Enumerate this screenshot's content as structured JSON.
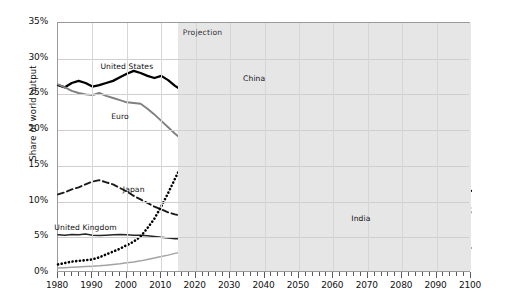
{
  "chart_data": {
    "type": "line",
    "title": "",
    "xlabel": "",
    "ylabel": "Share of world output",
    "xlim": [
      1980,
      2100
    ],
    "ylim": [
      0,
      35
    ],
    "grid": true,
    "legend_position": "inline-annotations",
    "y_tick_labels": [
      "35%",
      "30%",
      "25%",
      "20%",
      "15%",
      "10%",
      "5%",
      "0%"
    ],
    "y_tick_values": [
      35,
      30,
      25,
      20,
      15,
      10,
      5,
      0
    ],
    "x_tick_labels": [
      "1980",
      "1990",
      "2000",
      "2010",
      "2020",
      "2030",
      "2040",
      "2050",
      "2060",
      "2070",
      "2080",
      "2090",
      "2100"
    ],
    "x_tick_values": [
      1980,
      1990,
      2000,
      2010,
      2020,
      2030,
      2040,
      2050,
      2060,
      2070,
      2080,
      2090,
      2100
    ],
    "x_minor_tick_interval": 2,
    "annotations": [
      {
        "text": "Projection",
        "x": 2022,
        "y": 33.6,
        "kind": "region-label"
      }
    ],
    "shaded_regions": [
      {
        "label": "Projection",
        "x_start": 2015,
        "x_end": 2100,
        "color": "#e6e6e6"
      }
    ],
    "series": [
      {
        "name": "United States",
        "label_x": 2000,
        "label_y": 28.9,
        "style": "solid-thick",
        "color": "#000000",
        "x": [
          1980,
          1982,
          1984,
          1986,
          1988,
          1990,
          1992,
          1994,
          1996,
          1998,
          2000,
          2002,
          2004,
          2006,
          2008,
          2010,
          2012,
          2014,
          2015,
          2020,
          2025,
          2030,
          2035,
          2040,
          2045,
          2050,
          2055,
          2060,
          2065,
          2070,
          2075,
          2080,
          2085,
          2090,
          2095,
          2100
        ],
        "values": [
          26.3,
          26.0,
          26.6,
          26.9,
          26.6,
          26.1,
          26.3,
          26.6,
          26.9,
          27.4,
          27.9,
          28.3,
          28.0,
          27.6,
          27.3,
          27.6,
          27.0,
          26.2,
          25.9,
          24.6,
          23.4,
          22.2,
          21.0,
          19.8,
          18.7,
          17.6,
          16.6,
          15.7,
          14.9,
          14.2,
          13.5,
          12.9,
          12.4,
          12.0,
          11.7,
          11.5
        ]
      },
      {
        "name": "Euro",
        "label_x": 1998,
        "label_y": 21.8,
        "style": "solid-gray",
        "color": "#808080",
        "x": [
          1980,
          1982,
          1984,
          1986,
          1988,
          1990,
          1992,
          1994,
          1996,
          1998,
          2000,
          2002,
          2004,
          2006,
          2008,
          2010,
          2012,
          2014,
          2015,
          2020,
          2025,
          2030,
          2035,
          2040,
          2045,
          2050,
          2055,
          2060,
          2065,
          2070,
          2075,
          2080,
          2085,
          2090,
          2095,
          2100
        ],
        "values": [
          26.4,
          26.0,
          25.5,
          25.2,
          25.0,
          24.9,
          25.2,
          24.8,
          24.5,
          24.2,
          23.9,
          23.8,
          23.7,
          23.0,
          22.2,
          21.3,
          20.4,
          19.5,
          19.1,
          17.4,
          16.0,
          14.8,
          13.7,
          12.8,
          12.0,
          11.3,
          10.7,
          10.2,
          9.8,
          9.5,
          9.2,
          9.0,
          8.8,
          8.7,
          8.6,
          8.5
        ]
      },
      {
        "name": "Japan",
        "label_x": 2002,
        "label_y": 11.6,
        "style": "dashed",
        "color": "#1a1a1a",
        "x": [
          1980,
          1982,
          1984,
          1986,
          1988,
          1990,
          1992,
          1994,
          1996,
          1998,
          2000,
          2002,
          2004,
          2006,
          2008,
          2010,
          2012,
          2014,
          2015,
          2020,
          2025,
          2030,
          2035,
          2040,
          2045,
          2050,
          2055,
          2060,
          2065,
          2070,
          2075,
          2080,
          2085,
          2090,
          2095,
          2100
        ],
        "values": [
          11.0,
          11.3,
          11.7,
          12.0,
          12.4,
          12.8,
          13.0,
          12.7,
          12.4,
          11.9,
          11.4,
          10.8,
          10.3,
          9.8,
          9.3,
          8.9,
          8.5,
          8.2,
          8.1,
          7.6,
          7.2,
          6.9,
          6.6,
          6.3,
          6.0,
          5.7,
          5.4,
          5.2,
          4.9,
          4.7,
          4.5,
          4.3,
          4.2,
          4.1,
          4.0,
          4.0
        ]
      },
      {
        "name": "United Kingdom",
        "label_x": 1988,
        "label_y": 6.3,
        "style": "solid-thin",
        "color": "#262626",
        "x": [
          1980,
          1982,
          1984,
          1986,
          1988,
          1990,
          1992,
          1994,
          1996,
          1998,
          2000,
          2002,
          2004,
          2006,
          2008,
          2010,
          2012,
          2014,
          2015,
          2020,
          2025,
          2030,
          2035,
          2040,
          2045,
          2050,
          2055,
          2060,
          2065,
          2070,
          2075,
          2080,
          2085,
          2090,
          2095,
          2100
        ],
        "values": [
          5.35,
          5.3,
          5.4,
          5.35,
          5.45,
          5.3,
          5.25,
          5.3,
          5.35,
          5.4,
          5.35,
          5.3,
          5.3,
          5.2,
          5.1,
          5.0,
          4.9,
          4.8,
          4.78,
          4.65,
          4.55,
          4.48,
          4.42,
          4.35,
          4.28,
          4.2,
          4.12,
          4.05,
          3.95,
          3.85,
          3.75,
          3.68,
          3.6,
          3.55,
          3.5,
          3.5
        ]
      },
      {
        "name": "China",
        "label_x": 2037,
        "label_y": 27.1,
        "style": "dotted",
        "color": "#000000",
        "x": [
          1980,
          1982,
          1984,
          1986,
          1988,
          1990,
          1992,
          1994,
          1996,
          1998,
          2000,
          2002,
          2004,
          2006,
          2008,
          2010,
          2012,
          2014,
          2015,
          2020,
          2025,
          2030,
          2035,
          2040,
          2045,
          2050,
          2055,
          2060,
          2065,
          2070,
          2075,
          2080,
          2085,
          2090,
          2095,
          2100
        ],
        "values": [
          1.2,
          1.4,
          1.6,
          1.7,
          1.8,
          1.9,
          2.2,
          2.6,
          3.0,
          3.4,
          3.9,
          4.4,
          5.1,
          6.3,
          7.6,
          9.3,
          11.2,
          13.2,
          14.2,
          17.6,
          20.3,
          22.4,
          24.2,
          25.7,
          26.9,
          27.8,
          28.5,
          29.1,
          29.5,
          29.8,
          30.0,
          30.2,
          30.3,
          30.4,
          30.5,
          30.5
        ]
      },
      {
        "name": "India",
        "label_x": 2068,
        "label_y": 7.6,
        "style": "solid-lightgray",
        "color": "#a3a3a3",
        "x": [
          1980,
          1982,
          1984,
          1986,
          1988,
          1990,
          1992,
          1994,
          1996,
          1998,
          2000,
          2002,
          2004,
          2006,
          2008,
          2010,
          2012,
          2014,
          2015,
          2020,
          2025,
          2030,
          2035,
          2040,
          2045,
          2050,
          2055,
          2060,
          2065,
          2070,
          2075,
          2080,
          2085,
          2090,
          2095,
          2100
        ],
        "values": [
          0.7,
          0.75,
          0.8,
          0.85,
          0.9,
          0.95,
          1.0,
          1.1,
          1.2,
          1.3,
          1.45,
          1.55,
          1.7,
          1.9,
          2.1,
          2.3,
          2.5,
          2.75,
          2.85,
          3.3,
          3.8,
          4.3,
          4.8,
          5.3,
          5.8,
          6.3,
          6.8,
          7.2,
          7.6,
          7.9,
          8.2,
          8.45,
          8.65,
          8.85,
          9.0,
          9.1
        ]
      }
    ]
  }
}
